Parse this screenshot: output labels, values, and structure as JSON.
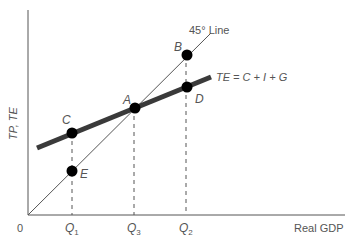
{
  "diagram": {
    "y_axis_label": "TP, TE",
    "x_axis_label": "Real GDP",
    "origin_label": "0",
    "line_45_label": "45° Line",
    "te_label": "TE = C + I + G",
    "x_ticks": [
      {
        "id": "q1",
        "label": "Q",
        "sub": "1",
        "x": 72
      },
      {
        "id": "q3",
        "label": "Q",
        "sub": "3",
        "x": 134
      },
      {
        "id": "q2",
        "label": "Q",
        "sub": "2",
        "x": 186
      }
    ],
    "points": [
      {
        "id": "A",
        "label": "A",
        "x": 135,
        "y": 108
      },
      {
        "id": "B",
        "label": "B",
        "x": 187,
        "y": 55
      },
      {
        "id": "C",
        "label": "C",
        "x": 72,
        "y": 133
      },
      {
        "id": "D",
        "label": "D",
        "x": 187,
        "y": 87
      },
      {
        "id": "E",
        "label": "E",
        "x": 72,
        "y": 171
      }
    ],
    "colors": {
      "axis": "#555555",
      "line_45": "#555555",
      "te_line": "#3a3a3a",
      "point": "#000000",
      "text": "#555555"
    }
  }
}
